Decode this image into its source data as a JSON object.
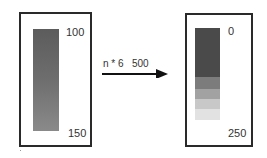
{
  "left_panel": {
    "top_label": "100",
    "bottom_label": "150"
  },
  "transform": {
    "label": "n * 6   500",
    "arrow": "right-arrow"
  },
  "right_panel": {
    "top_label": "0",
    "bottom_label": "250",
    "segments": [
      {
        "fraction": 0.53,
        "color": "#4a4a4a"
      },
      {
        "fraction": 0.13,
        "color": "#7c7c7c"
      },
      {
        "fraction": 0.11,
        "color": "#a2a2a2"
      },
      {
        "fraction": 0.11,
        "color": "#c8c8c8"
      },
      {
        "fraction": 0.12,
        "color": "#e2e2e2"
      }
    ]
  }
}
